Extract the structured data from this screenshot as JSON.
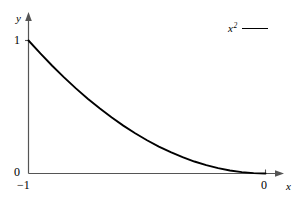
{
  "figure": {
    "background_color": "#ffffff",
    "line_color": "#000000",
    "axis_color": "#555555"
  },
  "axes": {
    "x_axis_label": "x",
    "y_axis_label": "y",
    "x_ticks": [
      "-1",
      "0"
    ],
    "y_ticks": [
      "0",
      "1"
    ]
  },
  "labels": {
    "y_name": "y",
    "x_name": "x",
    "y_one": "1",
    "y_zero": "0",
    "x_neg_one": "−1",
    "x_zero": "0"
  },
  "legend": {
    "base": "x",
    "exponent": "2",
    "full_label": "x²"
  },
  "chart_data": {
    "type": "line",
    "title": "",
    "xlabel": "x",
    "ylabel": "y",
    "xlim": [
      -1,
      0
    ],
    "ylim": [
      0,
      1
    ],
    "xticks": [
      -1,
      0
    ],
    "xticklabels": [
      "−1",
      "0"
    ],
    "yticks": [
      0,
      1
    ],
    "yticklabels": [
      "0",
      "1"
    ],
    "grid": false,
    "legend_position": "upper right",
    "series": [
      {
        "name": "x²",
        "color": "#000000",
        "x": [
          -1.0,
          -0.95,
          -0.9,
          -0.85,
          -0.8,
          -0.75,
          -0.7,
          -0.65,
          -0.6,
          -0.55,
          -0.5,
          -0.45,
          -0.4,
          -0.35,
          -0.3,
          -0.25,
          -0.2,
          -0.15,
          -0.1,
          -0.05,
          0.0
        ],
        "y": [
          1.0,
          0.9025,
          0.81,
          0.7225,
          0.64,
          0.5625,
          0.49,
          0.4225,
          0.36,
          0.3025,
          0.25,
          0.2025,
          0.16,
          0.1225,
          0.09,
          0.0625,
          0.04,
          0.0225,
          0.01,
          0.0025,
          0.0
        ]
      }
    ]
  }
}
